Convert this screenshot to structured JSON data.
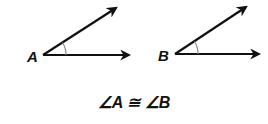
{
  "diagram": {
    "angles": [
      {
        "label": "A",
        "vertex": [
          43,
          55
        ],
        "ray1_end": [
          116,
          8
        ],
        "ray2_end": [
          129,
          55
        ]
      },
      {
        "label": "B",
        "vertex": [
          175,
          54
        ],
        "ray1_end": [
          246,
          7
        ],
        "ray2_end": [
          259,
          54
        ]
      }
    ],
    "caption": "∠A ≅ ∠B",
    "colors": {
      "stroke": "#111111",
      "arc": "#888888"
    }
  }
}
